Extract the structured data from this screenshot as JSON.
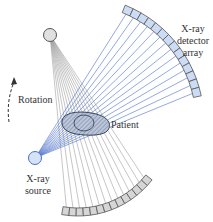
{
  "diagram": {
    "labels": {
      "detector_line1": "X-ray",
      "detector_line2": "detector",
      "detector_line3": "array",
      "rotation": "Rotation",
      "patient": "Patient",
      "source_line1": "X-ray",
      "source_line2": "source"
    },
    "colors": {
      "blue_beam": "#4a6fc9",
      "blue_detector_fill": "#cddcf5",
      "gray_beam": "#9a9a9a",
      "gray_detector_fill": "#d6d6d6",
      "outline": "#555555",
      "patient_fill": "#b9c3d8",
      "text": "#333333"
    },
    "components": {
      "current_source": {
        "cx": 35,
        "cy": 158,
        "r": 6
      },
      "previous_source": {
        "cx": 50,
        "cy": 35,
        "r": 6
      },
      "blue_detector": {
        "segments": 14
      },
      "gray_detector": {
        "segments": 14
      }
    }
  }
}
